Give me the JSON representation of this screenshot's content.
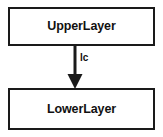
{
  "diagram": {
    "type": "block-diagram",
    "background_color": "#ffffff",
    "stroke_color": "#1a1a1a",
    "nodes": [
      {
        "id": "upper-layer",
        "label": "UpperLayer",
        "shape": "rectangle"
      },
      {
        "id": "lower-layer",
        "label": "LowerLayer",
        "shape": "rectangle"
      }
    ],
    "edges": [
      {
        "id": "upper-to-lower",
        "from": "upper-layer",
        "to": "lower-layer",
        "label": "lc",
        "arrow": "filled-triangle",
        "direction": "down"
      }
    ]
  }
}
